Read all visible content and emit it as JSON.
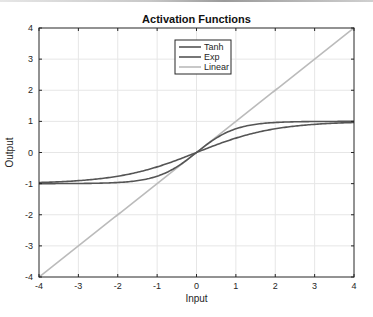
{
  "chart_data": {
    "type": "line",
    "title": "Activation Functions",
    "xlabel": "Input",
    "ylabel": "Output",
    "xlim": [
      -4,
      4
    ],
    "ylim": [
      -4,
      4
    ],
    "xticks": [
      -4,
      -3,
      -2,
      -1,
      0,
      1,
      2,
      3,
      4
    ],
    "yticks": [
      -4,
      -3,
      -2,
      -1,
      0,
      1,
      2,
      3,
      4
    ],
    "grid": true,
    "legend_position": "top-center",
    "x": [
      -4,
      -3,
      -2,
      -1,
      0,
      1,
      2,
      3,
      4
    ],
    "series": [
      {
        "name": "Tanh",
        "color": "#555555",
        "values": [
          -0.999,
          -0.995,
          -0.964,
          -0.762,
          0,
          0.762,
          0.964,
          0.995,
          0.999
        ]
      },
      {
        "name": "Exp",
        "color": "#555555",
        "values": [
          -0.964,
          -0.905,
          -0.762,
          -0.462,
          0,
          0.462,
          0.762,
          0.905,
          0.964
        ]
      },
      {
        "name": "Linear",
        "color": "#bbbbbb",
        "values": [
          -4,
          -3,
          -2,
          -1,
          0,
          1,
          2,
          3,
          4
        ]
      }
    ]
  },
  "legend": {
    "items": [
      {
        "label": "Tanh"
      },
      {
        "label": "Exp"
      },
      {
        "label": "Linear"
      }
    ]
  }
}
